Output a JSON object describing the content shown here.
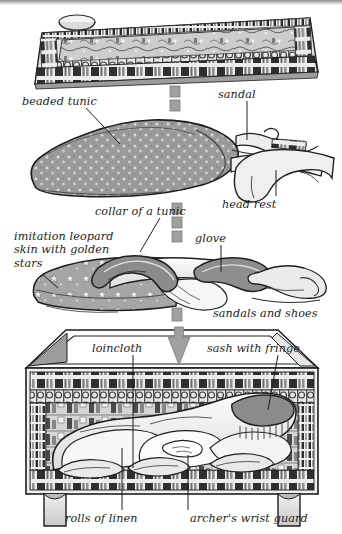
{
  "figure": {
    "type": "cutaway-illustration",
    "background_color": "#ffffff",
    "ink_color": "#1d1d1d",
    "fill_gray_dark": "#8f8f8f",
    "fill_gray_mid": "#b5b5b5",
    "fill_gray_light": "#e2e2e2",
    "arrow_color": "#a0a0a0"
  },
  "labels": [
    {
      "id": "beaded-tunic",
      "text": "beaded tunic",
      "x": 22,
      "y": 95,
      "align": "left"
    },
    {
      "id": "sandal",
      "text": "sandal",
      "x": 218,
      "y": 88,
      "align": "left"
    },
    {
      "id": "head-rest",
      "text": "head rest",
      "x": 222,
      "y": 198,
      "align": "left"
    },
    {
      "id": "collar-of-a-tunic",
      "text": "collar of a tunic",
      "x": 95,
      "y": 205,
      "align": "left"
    },
    {
      "id": "imitation-leopard",
      "text": "imitation leopard\nskin with golden\nstars",
      "x": 14,
      "y": 230,
      "align": "left"
    },
    {
      "id": "glove",
      "text": "glove",
      "x": 195,
      "y": 232,
      "align": "left"
    },
    {
      "id": "sandals-and-shoes",
      "text": "sandals and shoes",
      "x": 213,
      "y": 307,
      "align": "left"
    },
    {
      "id": "loincloth",
      "text": "loincloth",
      "x": 92,
      "y": 342,
      "align": "left"
    },
    {
      "id": "sash-with-fringe",
      "text": "sash with fringe",
      "x": 207,
      "y": 342,
      "align": "left"
    },
    {
      "id": "rolls-of-linen",
      "text": "rolls of linen",
      "x": 65,
      "y": 512,
      "align": "left"
    },
    {
      "id": "archers-wrist-guard",
      "text": "archer's wrist guard",
      "x": 190,
      "y": 512,
      "align": "left"
    }
  ],
  "leader_lines": [
    {
      "id": "leader-beaded-tunic",
      "from": [
        86,
        108
      ],
      "to": [
        120,
        144
      ]
    },
    {
      "id": "leader-sandal",
      "from": [
        247,
        101
      ],
      "to": [
        247,
        140
      ]
    },
    {
      "id": "leader-head-rest",
      "from": [
        276,
        196
      ],
      "to": [
        276,
        170
      ]
    },
    {
      "id": "leader-collar-of-a-tunic",
      "from": [
        160,
        218
      ],
      "to": [
        140,
        252
      ]
    },
    {
      "id": "leader-imitation-leopard",
      "from": [
        42,
        274
      ],
      "to": [
        58,
        288
      ]
    },
    {
      "id": "leader-glove",
      "from": [
        221,
        245
      ],
      "to": [
        221,
        272
      ]
    },
    {
      "id": "leader-loincloth",
      "from": [
        133,
        355
      ],
      "to": [
        133,
        468
      ]
    },
    {
      "id": "leader-sash-with-fringe",
      "from": [
        278,
        355
      ],
      "to": [
        268,
        410
      ]
    },
    {
      "id": "leader-rolls-of-linen",
      "from": [
        122,
        510
      ],
      "to": [
        122,
        448
      ]
    },
    {
      "id": "leader-archers-wrist-guard",
      "from": [
        188,
        510
      ],
      "to": [
        188,
        455
      ]
    }
  ],
  "arrows": [
    {
      "id": "arrow-segment-1",
      "kind": "dash",
      "x": 170,
      "y": 86,
      "w": 10,
      "h": 11
    },
    {
      "id": "arrow-segment-2",
      "kind": "dash",
      "x": 170,
      "y": 100,
      "w": 10,
      "h": 11
    },
    {
      "id": "arrow-segment-3",
      "kind": "dash",
      "x": 172,
      "y": 203,
      "w": 10,
      "h": 11
    },
    {
      "id": "arrow-segment-4",
      "kind": "dash",
      "x": 172,
      "y": 217,
      "w": 10,
      "h": 11
    },
    {
      "id": "arrow-segment-5",
      "kind": "dash",
      "x": 172,
      "y": 231,
      "w": 10,
      "h": 11
    },
    {
      "id": "arrow-segment-6",
      "kind": "dash",
      "x": 172,
      "y": 308,
      "w": 10,
      "h": 13
    },
    {
      "id": "arrow-head-1",
      "kind": "head",
      "x": 168,
      "y": 327,
      "w": 22,
      "h": 38
    }
  ],
  "objects": [
    {
      "id": "painted-chest-lid",
      "name": "painted chest lid with hunting scene",
      "row": 1
    },
    {
      "id": "lid-knob",
      "name": "lid knob",
      "row": 1
    },
    {
      "id": "beaded-tunic-object",
      "name": "beaded tunic bundle",
      "row": 2
    },
    {
      "id": "sandal-object",
      "name": "sandal",
      "row": 2
    },
    {
      "id": "head-rest-object",
      "name": "curved head rest",
      "row": 2
    },
    {
      "id": "leopard-skin-object",
      "name": "imitation leopard skin with golden stars",
      "row": 3
    },
    {
      "id": "collar-object",
      "name": "collar of a tunic",
      "row": 3
    },
    {
      "id": "glove-object",
      "name": "glove",
      "row": 3
    },
    {
      "id": "sandals-shoes-object",
      "name": "sandals and shoes",
      "row": 3
    },
    {
      "id": "chest-box",
      "name": "painted chest with packed contents",
      "row": 4
    },
    {
      "id": "loincloth-object",
      "name": "loincloth",
      "row": 4
    },
    {
      "id": "sash-object",
      "name": "sash with fringe",
      "row": 4
    },
    {
      "id": "rolls-of-linen-object",
      "name": "rolls of linen",
      "row": 4
    },
    {
      "id": "wrist-guard-object",
      "name": "archer's wrist guard",
      "row": 4
    }
  ]
}
